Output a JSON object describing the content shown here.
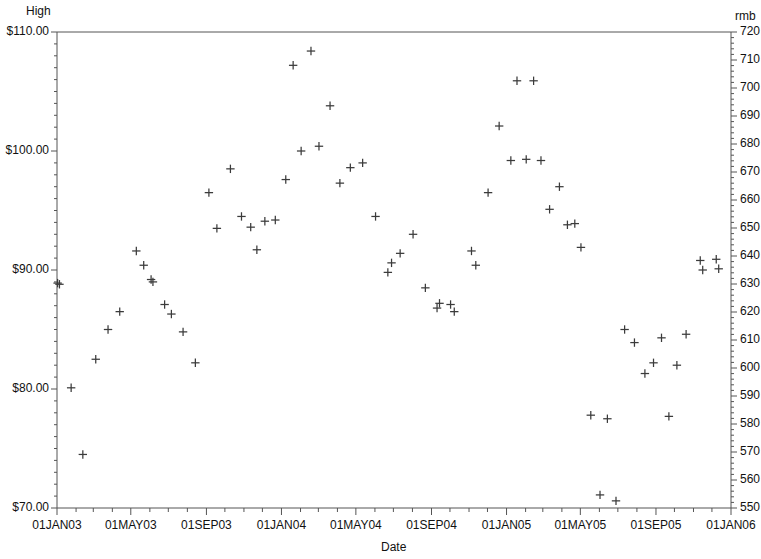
{
  "chart_data": {
    "type": "scatter",
    "title": "",
    "subtitle": "",
    "xlabel": "Date",
    "ylabel": "High",
    "y2label": "rmb",
    "grid": false,
    "legend": "none",
    "marker": "plus",
    "marker_color": "#3b3b3b",
    "axis_color": "#555555",
    "background": "#ffffff",
    "xlim": [
      "01JAN03",
      "01JAN06"
    ],
    "xtick_labels": [
      "01JAN03",
      "01MAY03",
      "01SEP03",
      "01JAN04",
      "01MAY04",
      "01SEP04",
      "01JAN05",
      "01MAY05",
      "01SEP05",
      "01JAN06"
    ],
    "xtick_interval": "monthly",
    "ylim": [
      70.0,
      110.0
    ],
    "ytick_labels": [
      "$110.00",
      "$100.00",
      "$90.00",
      "$80.00",
      "$70.00"
    ],
    "ytick_values": [
      110.0,
      100.0,
      90.0,
      80.0,
      70.0
    ],
    "y2lim": [
      550,
      720
    ],
    "y2tick_labels": [
      "720",
      "710",
      "700",
      "690",
      "680",
      "670",
      "660",
      "650",
      "640",
      "630",
      "620",
      "610",
      "600",
      "590",
      "580",
      "570",
      "560",
      "550"
    ],
    "y2tick_values": [
      720,
      710,
      700,
      690,
      680,
      670,
      660,
      650,
      640,
      630,
      620,
      610,
      600,
      590,
      580,
      570,
      560,
      550
    ],
    "series": [
      {
        "name": "High",
        "points": [
          {
            "x": "2003-01-02",
            "y": 88.9
          },
          {
            "x": "2003-01-05",
            "y": 88.8
          },
          {
            "x": "2003-01-24",
            "y": 80.1
          },
          {
            "x": "2003-02-12",
            "y": 74.5
          },
          {
            "x": "2003-03-05",
            "y": 82.5
          },
          {
            "x": "2003-03-25",
            "y": 85.0
          },
          {
            "x": "2003-04-13",
            "y": 86.5
          },
          {
            "x": "2003-05-10",
            "y": 91.6
          },
          {
            "x": "2003-05-22",
            "y": 90.4
          },
          {
            "x": "2003-06-03",
            "y": 89.2
          },
          {
            "x": "2003-06-06",
            "y": 89.0
          },
          {
            "x": "2003-06-25",
            "y": 87.1
          },
          {
            "x": "2003-07-06",
            "y": 86.3
          },
          {
            "x": "2003-07-25",
            "y": 84.8
          },
          {
            "x": "2003-08-14",
            "y": 82.2
          },
          {
            "x": "2003-09-05",
            "y": 96.5
          },
          {
            "x": "2003-09-18",
            "y": 93.5
          },
          {
            "x": "2003-10-10",
            "y": 98.5
          },
          {
            "x": "2003-10-28",
            "y": 94.5
          },
          {
            "x": "2003-11-12",
            "y": 93.6
          },
          {
            "x": "2003-11-22",
            "y": 91.7
          },
          {
            "x": "2003-12-05",
            "y": 94.1
          },
          {
            "x": "2003-12-22",
            "y": 94.2
          },
          {
            "x": "2004-01-08",
            "y": 97.6
          },
          {
            "x": "2004-01-20",
            "y": 107.2
          },
          {
            "x": "2004-02-02",
            "y": 100.0
          },
          {
            "x": "2004-02-18",
            "y": 108.4
          },
          {
            "x": "2004-03-02",
            "y": 100.4
          },
          {
            "x": "2004-03-20",
            "y": 103.8
          },
          {
            "x": "2004-04-05",
            "y": 97.3
          },
          {
            "x": "2004-04-22",
            "y": 98.6
          },
          {
            "x": "2004-05-12",
            "y": 99.0
          },
          {
            "x": "2004-06-02",
            "y": 94.5
          },
          {
            "x": "2004-06-22",
            "y": 89.8
          },
          {
            "x": "2004-06-28",
            "y": 90.6
          },
          {
            "x": "2004-07-12",
            "y": 91.4
          },
          {
            "x": "2004-08-02",
            "y": 93.0
          },
          {
            "x": "2004-08-22",
            "y": 88.5
          },
          {
            "x": "2004-09-10",
            "y": 86.8
          },
          {
            "x": "2004-09-14",
            "y": 87.2
          },
          {
            "x": "2004-10-02",
            "y": 87.1
          },
          {
            "x": "2004-10-08",
            "y": 86.5
          },
          {
            "x": "2004-11-05",
            "y": 91.6
          },
          {
            "x": "2004-11-12",
            "y": 90.4
          },
          {
            "x": "2004-12-02",
            "y": 96.5
          },
          {
            "x": "2004-12-20",
            "y": 102.1
          },
          {
            "x": "2005-01-08",
            "y": 99.2
          },
          {
            "x": "2005-01-18",
            "y": 105.9
          },
          {
            "x": "2005-02-02",
            "y": 99.3
          },
          {
            "x": "2005-02-14",
            "y": 105.9
          },
          {
            "x": "2005-02-26",
            "y": 99.2
          },
          {
            "x": "2005-03-12",
            "y": 95.1
          },
          {
            "x": "2005-03-28",
            "y": 97.0
          },
          {
            "x": "2005-04-10",
            "y": 93.8
          },
          {
            "x": "2005-04-22",
            "y": 93.9
          },
          {
            "x": "2005-05-02",
            "y": 91.9
          },
          {
            "x": "2005-05-18",
            "y": 77.8
          },
          {
            "x": "2005-06-02",
            "y": 71.1
          },
          {
            "x": "2005-06-14",
            "y": 77.5
          },
          {
            "x": "2005-06-28",
            "y": 70.6
          },
          {
            "x": "2005-07-12",
            "y": 85.0
          },
          {
            "x": "2005-07-28",
            "y": 83.9
          },
          {
            "x": "2005-08-14",
            "y": 81.3
          },
          {
            "x": "2005-08-28",
            "y": 82.2
          },
          {
            "x": "2005-09-10",
            "y": 84.3
          },
          {
            "x": "2005-09-22",
            "y": 77.7
          },
          {
            "x": "2005-10-05",
            "y": 82.0
          },
          {
            "x": "2005-10-20",
            "y": 84.6
          },
          {
            "x": "2005-11-12",
            "y": 90.8
          },
          {
            "x": "2005-11-16",
            "y": 90.0
          },
          {
            "x": "2005-12-08",
            "y": 90.9
          },
          {
            "x": "2005-12-12",
            "y": 90.1
          }
        ]
      }
    ],
    "plot_area": {
      "left": 57,
      "top": 32,
      "right": 731,
      "bottom": 508
    }
  }
}
